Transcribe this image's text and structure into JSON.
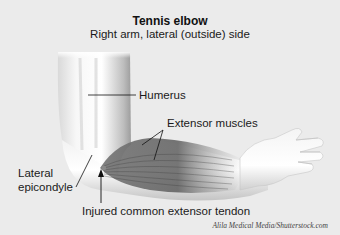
{
  "title": "Tennis elbow",
  "subtitle": "Right arm, lateral (outside) side",
  "labels": {
    "humerus": "Humerus",
    "extensor_muscles": "Extensor muscles",
    "lateral_epicondyle_line1": "Lateral",
    "lateral_epicondyle_line2": "epicondyle",
    "injured_tendon": "Injured common extensor tendon"
  },
  "credit": "Alila Medical Media/Shutterstock.com",
  "colors": {
    "background": "#ebebeb",
    "skin_light": "#f6f6f6",
    "skin_shadow": "#b8b8b8",
    "muscle": "#6e6e6e",
    "text": "#1a1a1a"
  }
}
